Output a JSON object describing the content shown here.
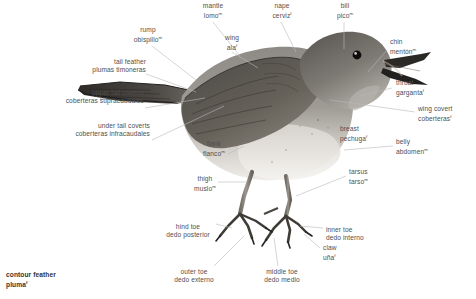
{
  "diagram": {
    "background_color": "#ffffff",
    "text_color": "#4f4f4f",
    "leader_color": "#b9b9b9"
  },
  "labels": [
    {
      "id": "mantle",
      "en": "mantle",
      "es": "lomo",
      "sup": "m",
      "align": "center"
    },
    {
      "id": "nape",
      "en": "nape",
      "es": "cerviz",
      "sup": "f",
      "align": "center"
    },
    {
      "id": "bill",
      "en": "bill",
      "es": "pico",
      "sup": "m",
      "align": "center"
    },
    {
      "id": "rump",
      "en": "rump",
      "es": "obispillo",
      "sup": "m",
      "align": "center"
    },
    {
      "id": "wing",
      "en": "wing",
      "es": "ala",
      "sup": "f",
      "align": "center"
    },
    {
      "id": "chin",
      "en": "chin",
      "es": "mentón",
      "sup": "m",
      "align": "left"
    },
    {
      "id": "tail-feather",
      "en": "tail feather",
      "es": "plumas timoneras",
      "sup": "f",
      "align": "right"
    },
    {
      "id": "throat",
      "en": "throat",
      "es": "garganta",
      "sup": "f",
      "align": "left"
    },
    {
      "id": "upper-tail-coverts",
      "en": "upper tail coverts",
      "es": "coberteras supracaudales",
      "sup": "f",
      "align": "right"
    },
    {
      "id": "wing-covert",
      "en": "wing covert",
      "es": "coberteras",
      "sup": "f",
      "align": "left"
    },
    {
      "id": "breast",
      "en": "breast",
      "es": "pechuga",
      "sup": "f",
      "align": "left"
    },
    {
      "id": "under-tail-coverts",
      "en": "under tail coverts",
      "es": "coberteras infracaudales",
      "sup": "f",
      "align": "right"
    },
    {
      "id": "flank",
      "en": "flank",
      "es": "flanco",
      "sup": "m",
      "align": "center"
    },
    {
      "id": "belly",
      "en": "belly",
      "es": "abdomen",
      "sup": "m",
      "align": "left"
    },
    {
      "id": "tarsus",
      "en": "tarsus",
      "es": "tarso",
      "sup": "m",
      "align": "left"
    },
    {
      "id": "thigh",
      "en": "thigh",
      "es": "muslo",
      "sup": "m",
      "align": "center"
    },
    {
      "id": "hind-toe",
      "en": "hind toe",
      "es": "dedo posterior",
      "sup": "m",
      "align": "center"
    },
    {
      "id": "inner-toe",
      "en": "inner toe",
      "es": "dedo interno",
      "sup": "m",
      "align": "left"
    },
    {
      "id": "claw",
      "en": "claw",
      "es": "uña",
      "sup": "f",
      "align": "left"
    },
    {
      "id": "outer-toe",
      "en": "outer toe",
      "es": "dedo externo",
      "sup": "m",
      "align": "center"
    },
    {
      "id": "middle-toe",
      "en": "middle toe",
      "es": "dedo medio",
      "sup": "m",
      "align": "center"
    },
    {
      "id": "contour-feather",
      "en": "contour feather",
      "es": "pluma",
      "sup": "f",
      "align": "left"
    }
  ]
}
